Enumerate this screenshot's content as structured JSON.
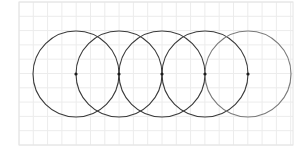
{
  "diagram": {
    "type": "overlapping-circles",
    "grid": {
      "x": 19,
      "y": 2,
      "width": 274,
      "height": 143,
      "spacing": 14.3,
      "line_color": "#ececec",
      "border_color": "#e4e4e4"
    },
    "circles": [
      {
        "cx": 76,
        "cy": 74,
        "r": 43,
        "stroke": "#3a3a3a"
      },
      {
        "cx": 119,
        "cy": 74,
        "r": 43,
        "stroke": "#3a3a3a"
      },
      {
        "cx": 162,
        "cy": 74,
        "r": 43,
        "stroke": "#3a3a3a"
      },
      {
        "cx": 205,
        "cy": 74,
        "r": 43,
        "stroke": "#3a3a3a"
      },
      {
        "cx": 248,
        "cy": 74,
        "r": 43,
        "stroke": "#7a7a7a"
      }
    ],
    "center_points": [
      {
        "x": 76,
        "y": 74
      },
      {
        "x": 119,
        "y": 74
      },
      {
        "x": 162,
        "y": 74
      },
      {
        "x": 205,
        "y": 74
      },
      {
        "x": 248,
        "y": 74
      }
    ],
    "point_color": "#1e1e1e",
    "point_radius": 1.6
  }
}
